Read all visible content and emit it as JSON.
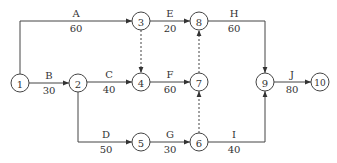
{
  "diagram": {
    "type": "activity-on-arrow network",
    "nodes": [
      {
        "id": "1",
        "label": "1",
        "x": 20,
        "y": 83
      },
      {
        "id": "2",
        "label": "2",
        "x": 78,
        "y": 83
      },
      {
        "id": "3",
        "label": "3",
        "x": 141,
        "y": 21
      },
      {
        "id": "4",
        "label": "4",
        "x": 141,
        "y": 82
      },
      {
        "id": "5",
        "label": "5",
        "x": 141,
        "y": 142
      },
      {
        "id": "6",
        "label": "6",
        "x": 199,
        "y": 142
      },
      {
        "id": "7",
        "label": "7",
        "x": 199,
        "y": 82
      },
      {
        "id": "8",
        "label": "8",
        "x": 199,
        "y": 21
      },
      {
        "id": "9",
        "label": "9",
        "x": 265,
        "y": 82
      },
      {
        "id": "10",
        "label": "10",
        "x": 320,
        "y": 82
      }
    ],
    "activities": [
      {
        "name": "A",
        "duration": "60",
        "from": "1",
        "to": "3"
      },
      {
        "name": "B",
        "duration": "30",
        "from": "1",
        "to": "2"
      },
      {
        "name": "C",
        "duration": "40",
        "from": "2",
        "to": "4"
      },
      {
        "name": "D",
        "duration": "50",
        "from": "2",
        "to": "5"
      },
      {
        "name": "E",
        "duration": "20",
        "from": "3",
        "to": "8"
      },
      {
        "name": "F",
        "duration": "60",
        "from": "4",
        "to": "7"
      },
      {
        "name": "G",
        "duration": "30",
        "from": "5",
        "to": "6"
      },
      {
        "name": "H",
        "duration": "60",
        "from": "8",
        "to": "9"
      },
      {
        "name": "I",
        "duration": "40",
        "from": "6",
        "to": "9"
      },
      {
        "name": "J",
        "duration": "80",
        "from": "9",
        "to": "10"
      }
    ],
    "dummies": [
      {
        "from": "3",
        "to": "4"
      },
      {
        "from": "7",
        "to": "8"
      },
      {
        "from": "6",
        "to": "7"
      }
    ]
  }
}
